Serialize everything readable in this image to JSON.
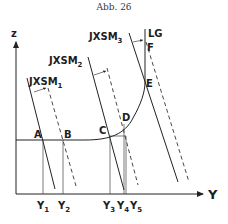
{
  "caption": "Abb. 26",
  "axes": {
    "vertical_label": "z",
    "horizontal_label": "Y"
  },
  "curves": {
    "lg_label": "LG",
    "jxsm1_label": "JXSM",
    "jxsm1_sub": "1",
    "jxsm2_label": "JXSM",
    "jxsm2_sub": "2",
    "jxsm3_label": "JXSM",
    "jxsm3_sub": "3"
  },
  "points": {
    "A": "A",
    "B": "B",
    "C": "C",
    "D": "D",
    "E": "E",
    "F": "F"
  },
  "ticks": [
    {
      "label": "Y",
      "sub": "1"
    },
    {
      "label": "Y",
      "sub": "2"
    },
    {
      "label": "Y",
      "sub": "3"
    },
    {
      "label": "Y",
      "sub": "4"
    },
    {
      "label": "Y",
      "sub": "5"
    }
  ],
  "colors": {
    "ink": "#222222",
    "background": "#ffffff"
  }
}
